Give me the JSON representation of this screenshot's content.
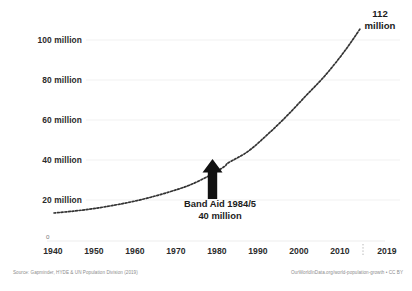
{
  "chart_data": {
    "type": "line",
    "title": "",
    "subtitle": "",
    "xlabel": "",
    "ylabel": "",
    "xlim": [
      1940,
      2019
    ],
    "ylim": [
      0,
      112
    ],
    "grid": true,
    "legend_position": "none",
    "y_tick_labels": [
      "100 million",
      "80 million",
      "60 million",
      "40 million",
      "20 million"
    ],
    "y_tick_values": [
      100,
      80,
      60,
      40,
      20
    ],
    "y_origin_label": "0",
    "x_tick_labels": [
      "1940",
      "1950",
      "1960",
      "1970",
      "1980",
      "1990",
      "2000",
      "2010",
      "2019"
    ],
    "x_tick_values": [
      1940,
      1950,
      1960,
      1970,
      1980,
      1990,
      2000,
      2010,
      2019
    ],
    "series": [
      {
        "name": "Ethiopia population",
        "style": "dotted",
        "color": "#333333",
        "x": [
          1940,
          1945,
          1950,
          1955,
          1960,
          1965,
          1970,
          1975,
          1980,
          1984,
          1985,
          1990,
          1995,
          2000,
          2005,
          2010,
          2015,
          2019
        ],
        "values": [
          13.0,
          14.0,
          15.3,
          17.0,
          19.0,
          21.5,
          24.5,
          28.0,
          33.0,
          38.0,
          40.0,
          46.0,
          55.0,
          65.0,
          76.0,
          87.0,
          100.0,
          112.0
        ]
      }
    ],
    "annotations": [
      {
        "name": "endpoint-callout",
        "text_line1": "112",
        "text_line2": "million",
        "x": 2019,
        "y": 112
      },
      {
        "name": "band-aid-callout",
        "text_line1": "Band Aid 1984/5",
        "text_line2": "40 million",
        "x": 1984,
        "y": 40,
        "marker": "up-arrow"
      }
    ]
  },
  "footer": {
    "source": "Source: Gapminder, HYDE & UN Population Division (2019)",
    "attribution": "OurWorldInData.org/world-population-growth • CC BY"
  },
  "colors": {
    "line": "#333333",
    "grid": "#f0f0f0",
    "axis": "#e8e8e8",
    "text": "#2b2b2b",
    "muted": "#8d8d8d",
    "arrow": "#111111"
  }
}
